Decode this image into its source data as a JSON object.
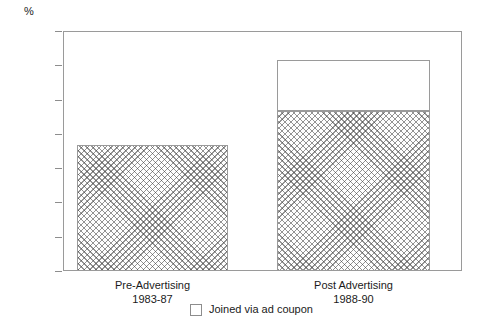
{
  "chart_data": {
    "type": "bar",
    "title": "",
    "subtitle": "",
    "xlabel": "",
    "ylabel": "%",
    "ylim": [
      0,
      35
    ],
    "ytick_step": 5,
    "yticks": [
      "35",
      "30",
      "25",
      "20",
      "15",
      "10",
      "5",
      "0"
    ],
    "grid": false,
    "legend_position": "bottom-center",
    "stacked": true,
    "categories": [
      "Pre-Advertising\n1983-87",
      "Post Advertising\n1988-90"
    ],
    "category_lines": [
      {
        "line1": "Pre-Advertising",
        "line2": "1983-87"
      },
      {
        "line1": "Post Advertising",
        "line2": "1988-90"
      }
    ],
    "series": [
      {
        "name": "Base",
        "fill": "crosshatch",
        "values": [
          18.4,
          23.3
        ]
      },
      {
        "name": "Joined via ad coupon",
        "fill": "white",
        "values": [
          0,
          7.4
        ]
      }
    ],
    "totals": [
      18.4,
      30.7
    ],
    "legend": [
      {
        "label": "Joined via ad coupon",
        "fill": "white"
      }
    ],
    "colors": {
      "axis": "#9a9a9a",
      "tick": "#8d8d8d",
      "hatch": "#3c3c3c",
      "plain": "#ffffff",
      "text": "#1a1a1a"
    }
  }
}
